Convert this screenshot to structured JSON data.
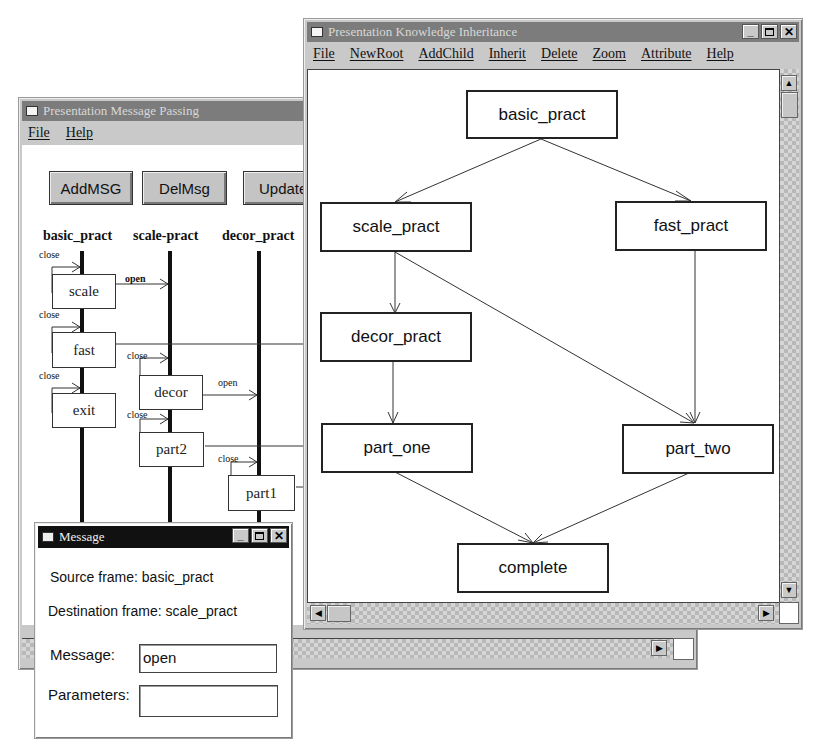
{
  "message_passing_window": {
    "title": "Presentation Message Passing",
    "menu": [
      "File",
      "Help"
    ],
    "buttons": [
      "AddMSG",
      "DelMsg",
      "Update"
    ],
    "lanes": [
      "basic_pract",
      "scale-pract",
      "decor_pract"
    ],
    "activations": [
      {
        "label": "scale",
        "self_message": "close",
        "outgoing": "open"
      },
      {
        "label": "fast",
        "self_message": "close"
      },
      {
        "label": "exit",
        "self_message": "close"
      },
      {
        "label": "decor",
        "self_message": "close",
        "outgoing": "open"
      },
      {
        "label": "part2",
        "self_message": "close"
      },
      {
        "label": "part1",
        "self_message": "close"
      }
    ]
  },
  "inheritance_window": {
    "title": "Presentation Knowledge Inheritance",
    "menu": [
      "File",
      "NewRoot",
      "AddChild",
      "Inherit",
      "Delete",
      "Zoom",
      "Attribute",
      "Help"
    ],
    "nodes": [
      "basic_pract",
      "scale_pract",
      "fast_pract",
      "decor_pract",
      "part_one",
      "part_two",
      "complete"
    ],
    "edges": [
      [
        "basic_pract",
        "scale_pract"
      ],
      [
        "basic_pract",
        "fast_pract"
      ],
      [
        "scale_pract",
        "decor_pract"
      ],
      [
        "scale_pract",
        "part_two"
      ],
      [
        "fast_pract",
        "part_two"
      ],
      [
        "decor_pract",
        "part_one"
      ],
      [
        "part_one",
        "complete"
      ],
      [
        "part_two",
        "complete"
      ]
    ]
  },
  "message_dialog": {
    "title": "Message",
    "source_label": "Source frame: basic_pract",
    "destination_label": "Destination frame: scale_pract",
    "message_label": "Message:",
    "message_value": "open",
    "parameters_label": "Parameters:",
    "parameters_value": ""
  },
  "window_controls": {
    "minimize": "_",
    "close": "✕"
  },
  "scroll_icons": {
    "up": "▲",
    "down": "▼",
    "left": "◀",
    "right": "▶"
  }
}
